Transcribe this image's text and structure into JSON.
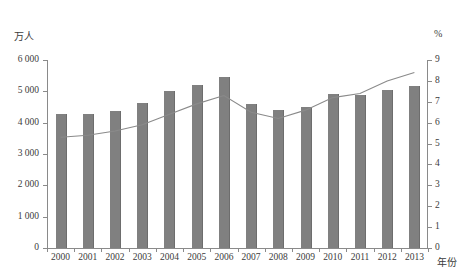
{
  "chart_data": {
    "type": "bar",
    "title": "",
    "xlabel": "年份",
    "ylabel": "万人",
    "y2label": "%",
    "categories": [
      "2000",
      "2001",
      "2002",
      "2003",
      "2004",
      "2005",
      "2006",
      "2007",
      "2008",
      "2009",
      "2010",
      "2011",
      "2012",
      "2013"
    ],
    "ylim": [
      0,
      6000
    ],
    "ytick_labels": [
      "0",
      "1 000",
      "2 000",
      "3 000",
      "4 000",
      "5 000",
      "6 000"
    ],
    "yticks": [
      0,
      1000,
      2000,
      3000,
      4000,
      5000,
      6000
    ],
    "y2lim": [
      0,
      9
    ],
    "y2ticks": [
      0,
      1,
      2,
      3,
      4,
      5,
      6,
      7,
      8,
      9
    ],
    "y2tick_labels": [
      "0",
      "1",
      "2",
      "3",
      "4",
      "5",
      "6",
      "7",
      "8",
      "9"
    ],
    "grid": false,
    "legend_position": "none",
    "series": [
      {
        "name": "万人",
        "kind": "bar",
        "axis": "left",
        "color": "#808080",
        "values": [
          4280,
          4290,
          4380,
          4620,
          5000,
          5200,
          5450,
          4600,
          4390,
          4490,
          4900,
          4890,
          5050,
          5180
        ]
      },
      {
        "name": "%",
        "kind": "line",
        "axis": "right",
        "color": "#8a8a8a",
        "values": [
          5.3,
          5.4,
          5.6,
          5.9,
          6.4,
          6.9,
          7.3,
          6.5,
          6.2,
          6.6,
          7.2,
          7.4,
          8.0,
          8.4
        ]
      }
    ]
  }
}
